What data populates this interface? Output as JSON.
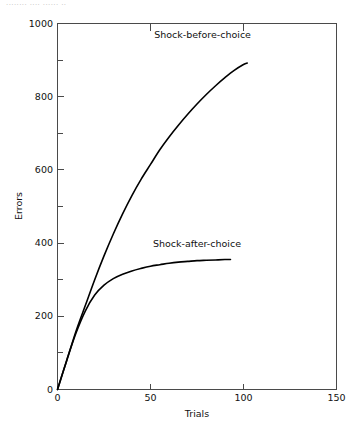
{
  "top_caption_fragment": "........  ....  ...... ..",
  "chart_data": {
    "type": "line",
    "title": "",
    "xlabel": "Trials",
    "ylabel": "Errors",
    "xlim": [
      0,
      150
    ],
    "ylim": [
      0,
      1000
    ],
    "grid": false,
    "legend_position": "inline-annotation",
    "x_major_ticks": [
      0,
      50,
      100,
      150
    ],
    "x_tick_labels": [
      "0",
      "50",
      "100",
      "150"
    ],
    "y_major_ticks": [
      0,
      200,
      400,
      600,
      800,
      1000
    ],
    "y_tick_labels": [
      "0",
      "200",
      "400",
      "600",
      "800",
      "1000"
    ],
    "y_minor_ticks": [
      100,
      300,
      500,
      700,
      900
    ],
    "series": [
      {
        "name": "Shock-before-choice",
        "label": "Shock-before-choice",
        "color": "#000000",
        "x": [
          0,
          5,
          10,
          15,
          20,
          25,
          30,
          35,
          40,
          45,
          50,
          55,
          60,
          65,
          70,
          75,
          80,
          85,
          90,
          95,
          100,
          102
        ],
        "values": [
          0,
          80,
          160,
          230,
          300,
          365,
          425,
          480,
          530,
          575,
          615,
          655,
          690,
          722,
          752,
          780,
          806,
          830,
          852,
          872,
          888,
          892
        ]
      },
      {
        "name": "Shock-after-choice",
        "label": "Shock-after-choice",
        "color": "#000000",
        "x": [
          0,
          5,
          10,
          15,
          20,
          25,
          30,
          35,
          40,
          45,
          50,
          55,
          60,
          65,
          70,
          75,
          80,
          85,
          90,
          93
        ],
        "values": [
          0,
          80,
          155,
          215,
          258,
          285,
          303,
          315,
          324,
          331,
          337,
          341,
          345,
          348,
          350,
          352,
          353,
          354,
          355,
          355
        ]
      }
    ],
    "annotations": [
      {
        "text": "Shock-before-choice",
        "x": 78,
        "y": 960
      },
      {
        "text": "Shock-after-choice",
        "x": 75,
        "y": 388
      }
    ]
  }
}
